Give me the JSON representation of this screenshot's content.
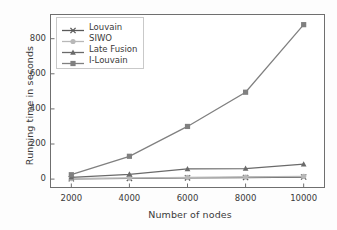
{
  "chart_data": {
    "type": "line",
    "title": "",
    "xlabel": "Number of nodes",
    "ylabel": "Running time in seconds",
    "x": [
      2000,
      4000,
      6000,
      8000,
      10000
    ],
    "xticklabels": [
      "2000",
      "4000",
      "6000",
      "8000",
      "10000"
    ],
    "yticks": [
      0,
      200,
      400,
      600,
      800
    ],
    "yticklabels": [
      "0",
      "200",
      "400",
      "600",
      "800"
    ],
    "xlim": [
      1300,
      10700
    ],
    "ylim": [
      -45,
      935
    ],
    "grid": false,
    "legend_position": "upper left",
    "series": [
      {
        "name": "Louvain",
        "marker": "x",
        "color": "#5a5a5a",
        "values": [
          2,
          4,
          7,
          9,
          12
        ]
      },
      {
        "name": "SIWO",
        "marker": "circle",
        "color": "#b8b8b8",
        "values": [
          3,
          6,
          10,
          12,
          16
        ]
      },
      {
        "name": "Late Fusion",
        "marker": "triangle",
        "color": "#6a6a6a",
        "values": [
          10,
          27,
          58,
          60,
          85
        ]
      },
      {
        "name": "I-Louvain",
        "marker": "square",
        "color": "#808080",
        "values": [
          25,
          130,
          300,
          495,
          880
        ]
      }
    ]
  },
  "axes": {
    "frame_color": "#6f6f6f",
    "tick_color": "#6f6f6f",
    "text_color": "#3a3a3a"
  },
  "legend": {
    "entries": [
      "Louvain",
      "SIWO",
      "Late Fusion",
      "I-Louvain"
    ],
    "border_color": "#c9c9c9",
    "background": "#ffffff"
  }
}
